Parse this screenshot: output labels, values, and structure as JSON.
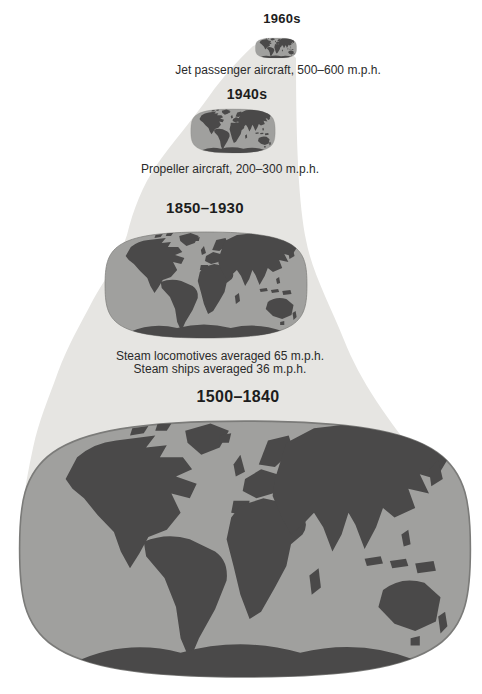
{
  "figure": {
    "colors": {
      "background": "#ffffff",
      "funnel": "#e6e5e2",
      "ocean": "#a0a09e",
      "land": "#4a4949",
      "text": "#1d1d1d"
    },
    "stages": [
      {
        "period": "1960s",
        "caption": "Jet passenger aircraft, 500–600 m.p.h."
      },
      {
        "period": "1940s",
        "caption": "Propeller aircraft, 200–300 m.p.h."
      },
      {
        "period": "1850–1930",
        "caption_line1": "Steam locomotives averaged 65 m.p.h.",
        "caption_line2": "Steam ships averaged 36 m.p.h."
      },
      {
        "period": "1500–1840"
      }
    ]
  }
}
